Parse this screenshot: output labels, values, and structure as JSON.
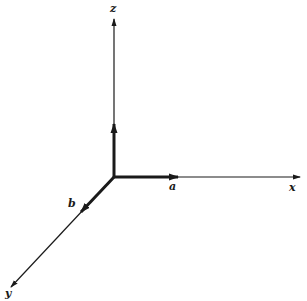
{
  "diagram": {
    "type": "3d-coordinate-axes",
    "axes": {
      "x": {
        "label": "x"
      },
      "y": {
        "label": "y"
      },
      "z": {
        "label": "z"
      }
    },
    "vectors": [
      {
        "name": "a",
        "label": "a",
        "along": "x"
      },
      {
        "name": "b",
        "label": "b",
        "along": "y"
      },
      {
        "name": "c",
        "label": "",
        "along": "z"
      }
    ],
    "colors": {
      "stroke": "#1a1a1a",
      "background": "#ffffff"
    }
  }
}
